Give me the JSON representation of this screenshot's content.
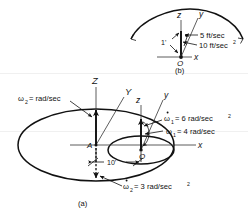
{
  "figure": {
    "caption_a": "(a)",
    "caption_b": "(b)",
    "detail_b": {
      "axis_z": "z",
      "axis_y": "y",
      "axis_x": "x",
      "origin": "O",
      "length_label": "1'",
      "velocity": "5 ft/sec",
      "acceleration_value": "10 ft/sec",
      "acceleration_exp": "2"
    },
    "main_a": {
      "axis_Z": "Z",
      "axis_Y": "Y",
      "axis_z": "z",
      "axis_y": "y",
      "axis_x": "x",
      "point_A": "A",
      "point_O": "O",
      "distance_label": "10'",
      "omega2": {
        "symbol": "ω",
        "sub": "2",
        "eq": "= rad/sec",
        "exp": ""
      },
      "omega1_dot": {
        "symbol": "ω",
        "sub": "1",
        "eq": "= 6 rad/sec",
        "exp": "2",
        "dot": true
      },
      "omega1": {
        "symbol": "ω",
        "sub": "1",
        "eq": "= 4 rad/sec",
        "exp": "",
        "dot": false
      },
      "omega2_dot": {
        "symbol": "ω",
        "sub": "2",
        "eq": "= 3 rad/sec",
        "exp": "2",
        "dot": true
      }
    }
  },
  "colors": {
    "ink": "#111111",
    "background": "#ffffff",
    "axis": "#333333"
  }
}
